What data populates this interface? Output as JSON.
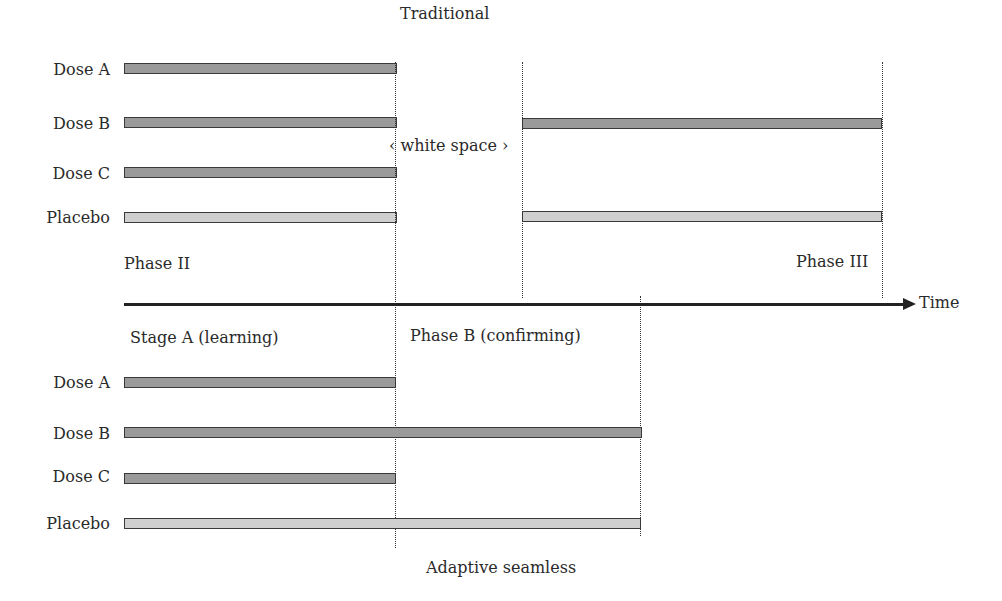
{
  "diagram": {
    "traditional": {
      "title": "Traditional",
      "phase2_label": "Phase II",
      "phase3_label": "Phase III",
      "gap_label": "‹ white space ›",
      "rows": [
        {
          "label": "Dose A",
          "type": "dose",
          "phase2": true,
          "phase3": false
        },
        {
          "label": "Dose B",
          "type": "dose",
          "phase2": true,
          "phase3": true
        },
        {
          "label": "Dose C",
          "type": "dose",
          "phase2": true,
          "phase3": false
        },
        {
          "label": "Placebo",
          "type": "placebo",
          "phase2": true,
          "phase3": true
        }
      ]
    },
    "axis": {
      "label": "Time"
    },
    "adaptive": {
      "title": "Adaptive seamless",
      "stage_a_label": "Stage A (learning)",
      "stage_b_label": "Phase B (confirming)",
      "rows": [
        {
          "label": "Dose A",
          "type": "dose",
          "continues": false
        },
        {
          "label": "Dose B",
          "type": "dose",
          "continues": true
        },
        {
          "label": "Dose C",
          "type": "dose",
          "continues": false
        },
        {
          "label": "Placebo",
          "type": "placebo",
          "continues": true
        }
      ]
    },
    "colors": {
      "dose_bar": "#9a9a9a",
      "placebo_bar": "#cfcfcf",
      "outline": "#3a3a3a"
    }
  }
}
